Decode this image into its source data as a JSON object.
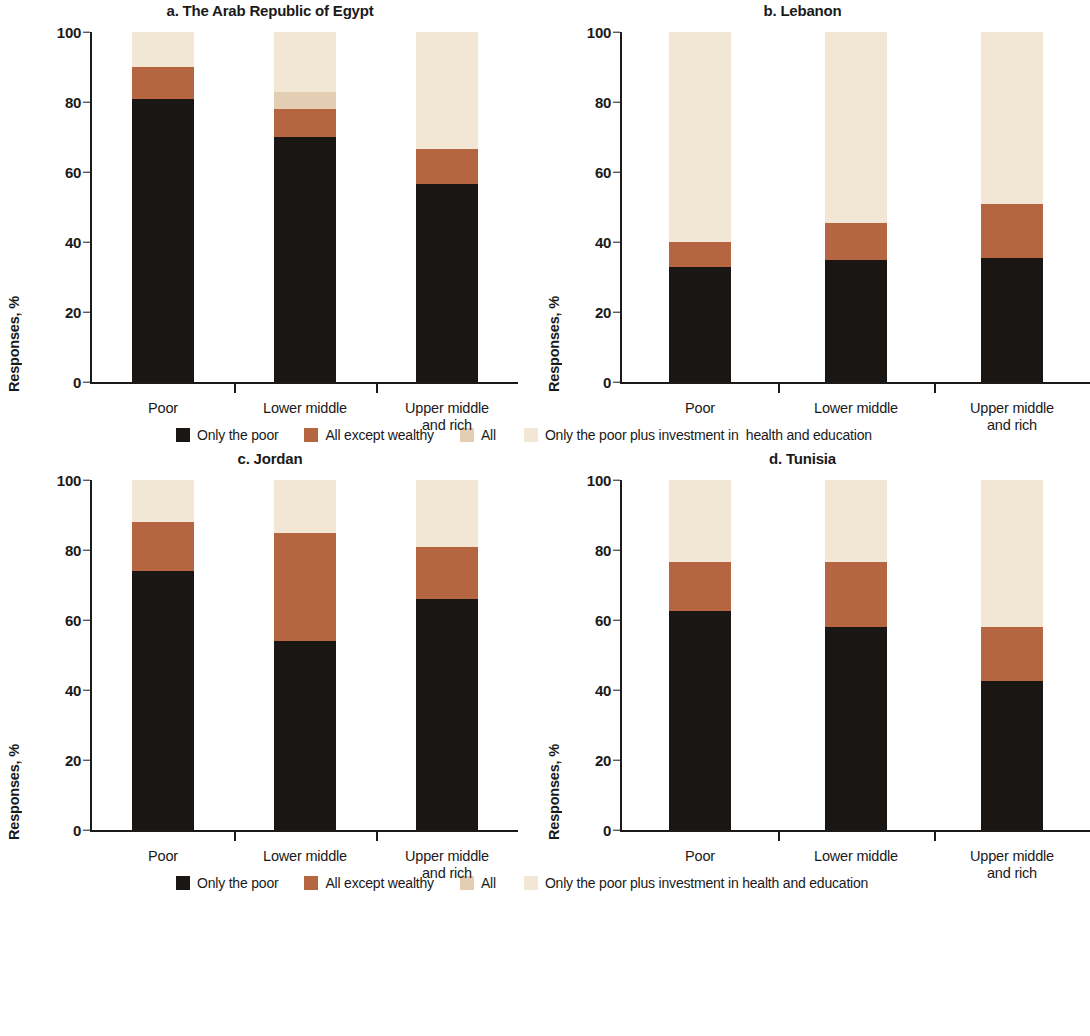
{
  "chart_data": {
    "type": "bar",
    "subtype": "stacked-bar-100-percent",
    "title": "",
    "ylabel": "Responses, %",
    "xlabel": "",
    "ylim": [
      0,
      100
    ],
    "yticks": [
      0,
      20,
      40,
      60,
      80,
      100
    ],
    "grid": false,
    "legend_position": "below-panels",
    "categories": [
      "Poor",
      "Lower middle",
      "Upper middle and rich"
    ],
    "series_names": [
      "Only the poor",
      "All except wealthy",
      "All",
      "Only the poor plus investment in health and education"
    ],
    "colors": {
      "only_the_poor": "#1a1614",
      "all_except_wealthy": "#b5653f",
      "all": "#e3cdb3",
      "only_poor_plus_investment": "#f2e6d5"
    },
    "panels": [
      {
        "label": "a",
        "title": "a. The Arab Republic of Egypt",
        "series": [
          {
            "name": "Only the poor",
            "values": [
              81,
              70,
              56.5
            ]
          },
          {
            "name": "All except wealthy",
            "values": [
              9,
              8,
              10
            ]
          },
          {
            "name": "All",
            "values": [
              0,
              5,
              0
            ]
          },
          {
            "name": "Only the poor plus investment in health and education",
            "values": [
              10,
              17,
              33.5
            ]
          }
        ]
      },
      {
        "label": "b",
        "title": "b. Lebanon",
        "series": [
          {
            "name": "Only the poor",
            "values": [
              33,
              35,
              35.5
            ]
          },
          {
            "name": "All except wealthy",
            "values": [
              7,
              10.5,
              15.5
            ]
          },
          {
            "name": "All",
            "values": [
              0,
              0,
              0
            ]
          },
          {
            "name": "Only the poor plus investment in health and education",
            "values": [
              60,
              54.5,
              49
            ]
          }
        ]
      },
      {
        "label": "c",
        "title": "c. Jordan",
        "series": [
          {
            "name": "Only the poor",
            "values": [
              74,
              54,
              66
            ]
          },
          {
            "name": "All except wealthy",
            "values": [
              14,
              31,
              15
            ]
          },
          {
            "name": "All",
            "values": [
              0,
              0,
              0
            ]
          },
          {
            "name": "Only the poor plus investment in health and education",
            "values": [
              12,
              15,
              19
            ]
          }
        ]
      },
      {
        "label": "d",
        "title": "d. Tunisia",
        "series": [
          {
            "name": "Only the poor",
            "values": [
              62.5,
              58,
              42.5
            ]
          },
          {
            "name": "All except wealthy",
            "values": [
              14,
              18.5,
              15.5
            ]
          },
          {
            "name": "All",
            "values": [
              0,
              0,
              0
            ]
          },
          {
            "name": "Only the poor plus investment in health and education",
            "values": [
              23.5,
              23.5,
              42
            ]
          }
        ]
      }
    ]
  },
  "panel_a": {
    "title": "a. The Arab Republic of Egypt",
    "ylabel": "Responses, %"
  },
  "panel_b": {
    "title": "b. Lebanon",
    "ylabel": "Responses, %"
  },
  "panel_c": {
    "title": "c. Jordan",
    "ylabel": "Responses, %"
  },
  "panel_d": {
    "title": "d. Tunisia",
    "ylabel": "Responses, %"
  },
  "yticks": {
    "t0": "0",
    "t20": "20",
    "t40": "40",
    "t60": "60",
    "t80": "80",
    "t100": "100"
  },
  "xlabels": {
    "poor": "Poor",
    "lower_middle": "Lower middle",
    "upper_middle_1": "Upper middle",
    "upper_middle_2": "and rich"
  },
  "legend_top": {
    "item1": "Only the poor",
    "item2": "All except wealthy",
    "item3": "All",
    "item4": "Only the poor plus investment in  health and education"
  },
  "legend_bottom": {
    "item1": "Only the poor",
    "item2": "All except wealthy",
    "item3": "All",
    "item4": "Only the poor plus investment in health and education"
  }
}
